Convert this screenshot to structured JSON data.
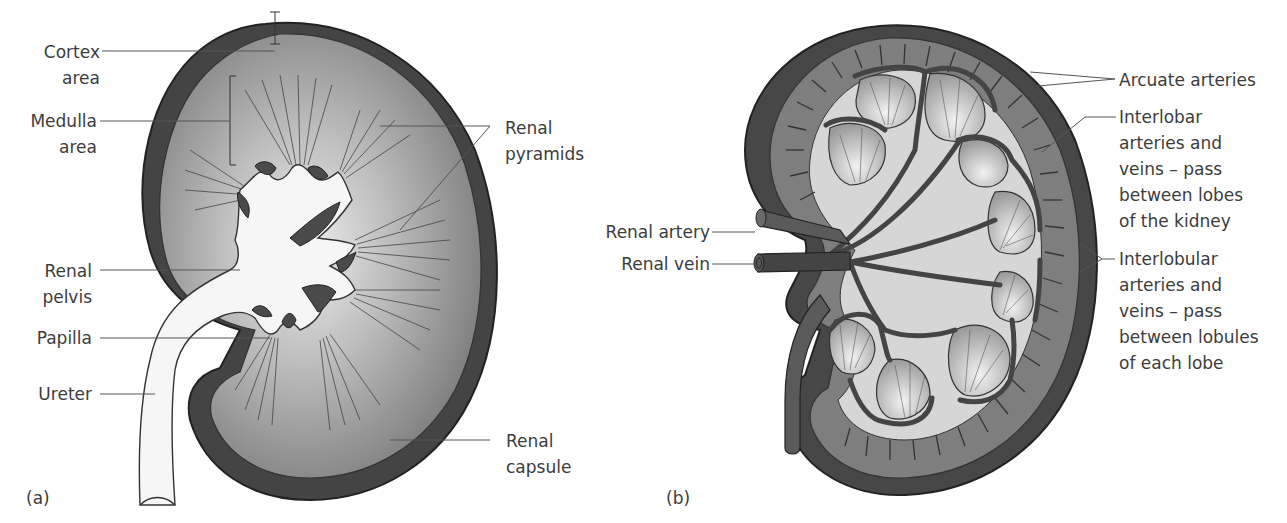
{
  "figure": {
    "panels": [
      {
        "id": "a",
        "letter": "(a)",
        "title": "Kidney cross-section (structure)",
        "labels": {
          "cortex": [
            "Cortex",
            "area"
          ],
          "medulla": [
            "Medulla",
            "area"
          ],
          "pyramids": [
            "Renal",
            "pyramids"
          ],
          "pelvis": [
            "Renal",
            "pelvis"
          ],
          "papilla": [
            "Papilla"
          ],
          "ureter": [
            "Ureter"
          ],
          "capsule": [
            "Renal",
            "capsule"
          ]
        }
      },
      {
        "id": "b",
        "letter": "(b)",
        "title": "Kidney blood supply",
        "labels": {
          "renal_artery": [
            "Renal artery"
          ],
          "renal_vein": [
            "Renal vein"
          ],
          "arcuate": [
            "Arcuate arteries"
          ],
          "interlobar": [
            "Interlobar",
            "arteries and",
            "veins – pass",
            "between lobes",
            "of the kidney"
          ],
          "interlobular": [
            "Interlobular",
            "arteries and",
            "veins – pass",
            "between lobules",
            "of each lobe"
          ]
        }
      }
    ],
    "colors": {
      "capsule_dark": "#4a4a4a",
      "tissue_mid": "#8a8a8a",
      "tissue_light": "#d8d8d8",
      "pelvis_white": "#f4f4f4",
      "vessel": "#555555",
      "leader_line": "#555555",
      "text": "#3c3c3c"
    }
  }
}
